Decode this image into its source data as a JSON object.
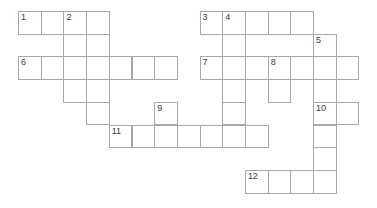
{
  "puzzle": {
    "title": "Crossword Puzzle Grid",
    "cell_size": 22.7,
    "origin_x": 18,
    "origin_y": 11,
    "cell_border_color": "#a8a8a8",
    "cell_fill_color": "#ffffff",
    "background_color": "#ffffff",
    "number_color": "#3a3a3a",
    "columns": 16,
    "rows": 9,
    "cells": [
      {
        "name": "cell-r0c0",
        "col": 0,
        "row": 0,
        "number": "1"
      },
      {
        "name": "cell-r0c1",
        "col": 1,
        "row": 0,
        "number": ""
      },
      {
        "name": "cell-r0c2",
        "col": 2,
        "row": 0,
        "number": "2"
      },
      {
        "name": "cell-r0c3",
        "col": 3,
        "row": 0,
        "number": ""
      },
      {
        "name": "cell-r1c2",
        "col": 2,
        "row": 1,
        "number": ""
      },
      {
        "name": "cell-r1c3",
        "col": 3,
        "row": 1,
        "number": ""
      },
      {
        "name": "cell-r2c0",
        "col": 0,
        "row": 2,
        "number": "6"
      },
      {
        "name": "cell-r2c1",
        "col": 1,
        "row": 2,
        "number": ""
      },
      {
        "name": "cell-r2c2",
        "col": 2,
        "row": 2,
        "number": ""
      },
      {
        "name": "cell-r2c3",
        "col": 3,
        "row": 2,
        "number": ""
      },
      {
        "name": "cell-r2c4",
        "col": 4,
        "row": 2,
        "number": ""
      },
      {
        "name": "cell-r2c5",
        "col": 5,
        "row": 2,
        "number": ""
      },
      {
        "name": "cell-r2c6",
        "col": 6,
        "row": 2,
        "number": ""
      },
      {
        "name": "cell-r3c2",
        "col": 2,
        "row": 3,
        "number": ""
      },
      {
        "name": "cell-r3c3",
        "col": 3,
        "row": 3,
        "number": ""
      },
      {
        "name": "cell-r4c3",
        "col": 3,
        "row": 4,
        "number": ""
      },
      {
        "name": "cell-r0c8",
        "col": 8,
        "row": 0,
        "number": "3"
      },
      {
        "name": "cell-r0c9",
        "col": 9,
        "row": 0,
        "number": "4"
      },
      {
        "name": "cell-r0c10",
        "col": 10,
        "row": 0,
        "number": ""
      },
      {
        "name": "cell-r0c11",
        "col": 11,
        "row": 0,
        "number": ""
      },
      {
        "name": "cell-r0c12",
        "col": 12,
        "row": 0,
        "number": ""
      },
      {
        "name": "cell-r1c9",
        "col": 9,
        "row": 1,
        "number": ""
      },
      {
        "name": "cell-r1c13",
        "col": 13,
        "row": 1,
        "number": "5"
      },
      {
        "name": "cell-r2c8",
        "col": 8,
        "row": 2,
        "number": "7"
      },
      {
        "name": "cell-r2c9",
        "col": 9,
        "row": 2,
        "number": ""
      },
      {
        "name": "cell-r2c10",
        "col": 10,
        "row": 2,
        "number": ""
      },
      {
        "name": "cell-r2c11",
        "col": 11,
        "row": 2,
        "number": "8"
      },
      {
        "name": "cell-r2c12",
        "col": 12,
        "row": 2,
        "number": ""
      },
      {
        "name": "cell-r2c13",
        "col": 13,
        "row": 2,
        "number": ""
      },
      {
        "name": "cell-r2c14",
        "col": 14,
        "row": 2,
        "number": ""
      },
      {
        "name": "cell-r3c9",
        "col": 9,
        "row": 3,
        "number": ""
      },
      {
        "name": "cell-r3c11",
        "col": 11,
        "row": 3,
        "number": ""
      },
      {
        "name": "cell-r3c13",
        "col": 13,
        "row": 3,
        "number": ""
      },
      {
        "name": "cell-r4c9",
        "col": 9,
        "row": 4,
        "number": ""
      },
      {
        "name": "cell-r4c13",
        "col": 13,
        "row": 4,
        "number": "10"
      },
      {
        "name": "cell-r4c14",
        "col": 14,
        "row": 4,
        "number": ""
      },
      {
        "name": "cell-r4c6",
        "col": 6,
        "row": 4,
        "number": "9"
      },
      {
        "name": "cell-r5c4",
        "col": 4,
        "row": 5,
        "number": "11"
      },
      {
        "name": "cell-r5c5",
        "col": 5,
        "row": 5,
        "number": ""
      },
      {
        "name": "cell-r5c6",
        "col": 6,
        "row": 5,
        "number": ""
      },
      {
        "name": "cell-r5c7",
        "col": 7,
        "row": 5,
        "number": ""
      },
      {
        "name": "cell-r5c8",
        "col": 8,
        "row": 5,
        "number": ""
      },
      {
        "name": "cell-r5c9",
        "col": 9,
        "row": 5,
        "number": ""
      },
      {
        "name": "cell-r5c10",
        "col": 10,
        "row": 5,
        "number": ""
      },
      {
        "name": "cell-r5c13",
        "col": 13,
        "row": 5,
        "number": ""
      },
      {
        "name": "cell-r6c13",
        "col": 13,
        "row": 6,
        "number": ""
      },
      {
        "name": "cell-r7c10",
        "col": 10,
        "row": 7,
        "number": "12"
      },
      {
        "name": "cell-r7c11",
        "col": 11,
        "row": 7,
        "number": ""
      },
      {
        "name": "cell-r7c12",
        "col": 12,
        "row": 7,
        "number": ""
      },
      {
        "name": "cell-r7c13",
        "col": 13,
        "row": 7,
        "number": ""
      }
    ]
  }
}
